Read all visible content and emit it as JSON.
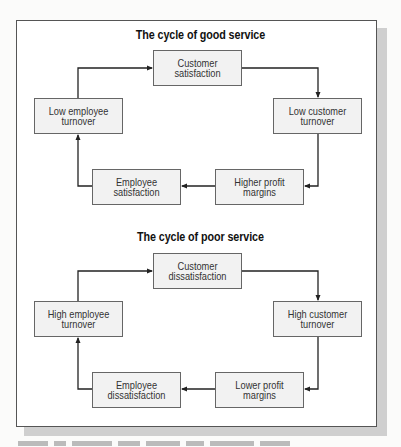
{
  "diagrams": [
    {
      "title": "The cycle of good service",
      "nodes": {
        "top": "Customer satisfaction",
        "right": "Low customer turnover",
        "bottom_right": "Higher profit margins",
        "bottom_left": "Employee satisfaction",
        "left": "Low employee turnover"
      },
      "flow": [
        "Customer satisfaction",
        "Low customer turnover",
        "Higher profit margins",
        "Employee satisfaction",
        "Low employee turnover",
        "Customer satisfaction"
      ]
    },
    {
      "title": "The cycle of poor service",
      "nodes": {
        "top": "Customer dissatisfaction",
        "right": "High customer turnover",
        "bottom_right": "Lower profit margins",
        "bottom_left": "Employee dissatisfaction",
        "left": "High employee turnover"
      },
      "flow": [
        "Customer dissatisfaction",
        "High customer turnover",
        "Lower profit margins",
        "Employee dissatisfaction",
        "High employee turnover",
        "Customer dissatisfaction"
      ]
    }
  ],
  "colors": {
    "box_fill": "#f2f2f2",
    "box_border": "#666666",
    "arrow": "#222222",
    "shadow": "#cfcfcf"
  }
}
